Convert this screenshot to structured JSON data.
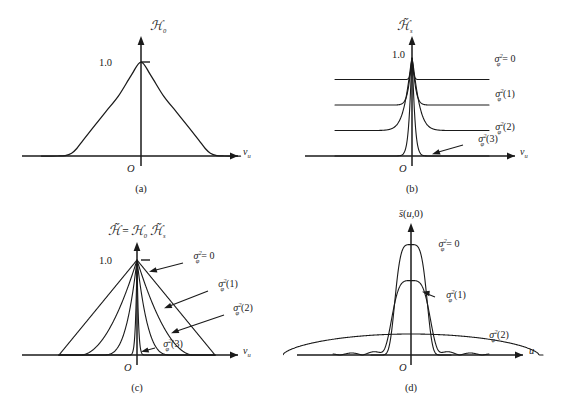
{
  "figure": {
    "background": "#ffffff",
    "ink": "#1a1a1a",
    "panel_count": 4
  },
  "chart_data": [
    {
      "id": "a",
      "type": "line",
      "caption": "(a)",
      "title": "",
      "ylabel": "H0",
      "ylabel_display": "ℋ₀",
      "xlabel": "νᵤ",
      "origin_label": "O",
      "ytick_labels": [
        "1.0"
      ],
      "ytick_values": [
        1.0
      ],
      "ylim": [
        0,
        1.18
      ],
      "xlim": [
        -1.55,
        1.55
      ],
      "grid": false,
      "legend": "none",
      "series": [
        {
          "name": "H0 triangle",
          "sigma_label": "",
          "description": "triangular autocorrelation-like function, peak 1.0 at nu=0, support [-1,1]",
          "x": [
            -1.55,
            -1.3,
            -1.18,
            -1.08,
            -1.0,
            -0.9,
            -0.75,
            -0.55,
            -0.35,
            -0.15,
            0.0,
            0.15,
            0.35,
            0.55,
            0.75,
            0.9,
            1.0,
            1.08,
            1.18,
            1.3,
            1.55
          ],
          "y": [
            0.0,
            0.0,
            0.005,
            0.03,
            0.08,
            0.17,
            0.3,
            0.47,
            0.64,
            0.86,
            1.0,
            0.86,
            0.64,
            0.47,
            0.3,
            0.17,
            0.08,
            0.03,
            0.005,
            0.0,
            0.0
          ]
        }
      ]
    },
    {
      "id": "b",
      "type": "line",
      "caption": "(b)",
      "title": "",
      "ylabel": "Hs tilde",
      "ylabel_display": "ℋ̃ₛ",
      "xlabel": "νᵤ",
      "origin_label": "O",
      "ytick_labels": [
        "1.0"
      ],
      "ytick_values": [
        1.0
      ],
      "ylim": [
        0,
        1.18
      ],
      "xlim": [
        -1.55,
        1.55
      ],
      "grid": false,
      "legend": "right-of-curve",
      "note": "Four curves drawn with vertical baseline offsets for clarity; all peak at 1.0",
      "series": [
        {
          "name": "sigma0",
          "sigma_label": "σ",
          "sigma_sup": "2",
          "sigma_sub": "φ",
          "sigma_arg": "= 0",
          "baseline": 0.78,
          "halfwidth": 0.03,
          "peak": 1.0,
          "arrow": false
        },
        {
          "name": "sigma1",
          "sigma_label": "σ",
          "sigma_sup": "2",
          "sigma_sub": "φ",
          "sigma_arg": "(1)",
          "baseline": 0.52,
          "halfwidth": 0.075,
          "peak": 1.0,
          "arrow": false
        },
        {
          "name": "sigma2",
          "sigma_label": "σ",
          "sigma_sup": "2",
          "sigma_sub": "φ",
          "sigma_arg": "(2)",
          "baseline": 0.26,
          "halfwidth": 0.15,
          "peak": 1.0,
          "arrow": false
        },
        {
          "name": "sigma3",
          "sigma_label": "σ",
          "sigma_sup": "2",
          "sigma_sub": "φ",
          "sigma_arg": "(3)",
          "baseline": 0.0,
          "halfwidth": 0.062,
          "peak": 1.0,
          "arrow": true
        }
      ]
    },
    {
      "id": "c",
      "type": "line",
      "caption": "(c)",
      "title": "H tilde = H0 Hs tilde",
      "title_display": "ℋ̃ = ℋ₀ ℋ̃ₛ",
      "ylabel": "",
      "xlabel": "νᵤ",
      "origin_label": "O",
      "ytick_labels": [
        "1.0"
      ],
      "ytick_values": [
        1.0
      ],
      "ylim": [
        0,
        1.18
      ],
      "xlim": [
        -1.55,
        1.55
      ],
      "grid": false,
      "legend": "arrow-callouts",
      "note": "Product of panel (a) triangle with panel (b) peaked curves; progressively narrower",
      "series": [
        {
          "name": "sigma0",
          "sigma_label": "σ",
          "sigma_sup": "2",
          "sigma_sub": "φ",
          "sigma_arg": "= 0",
          "width_scale": 1.0,
          "exponent": 1.0,
          "peak": 1.0
        },
        {
          "name": "sigma1",
          "sigma_label": "σ",
          "sigma_sup": "2",
          "sigma_sub": "φ",
          "sigma_arg": "(1)",
          "width_scale": 0.72,
          "exponent": 1.9,
          "peak": 1.0
        },
        {
          "name": "sigma2",
          "sigma_label": "σ",
          "sigma_sup": "2",
          "sigma_sub": "φ",
          "sigma_arg": "(2)",
          "width_scale": 0.45,
          "exponent": 3.2,
          "peak": 1.0
        },
        {
          "name": "sigma3",
          "sigma_label": "σ",
          "sigma_sup": "2",
          "sigma_sub": "φ",
          "sigma_arg": "(3)",
          "width_scale": 0.14,
          "exponent": 7.0,
          "peak": 1.0
        }
      ]
    },
    {
      "id": "d",
      "type": "line",
      "caption": "(d)",
      "title": "",
      "ylabel": "s bar (u,0)",
      "ylabel_display": "s̄(u,0)",
      "xlabel": "u",
      "origin_label": "O",
      "ytick_labels": [],
      "ytick_values": [],
      "ylim": [
        0,
        1.12
      ],
      "xlim": [
        -1.55,
        1.55
      ],
      "grid": false,
      "legend": "labels-near-curves",
      "note": "Point-spread functions: narrow tall main lobe broadens and collapses into wide low pedestal with ripples as sigma grows",
      "series": [
        {
          "name": "sigma0",
          "sigma_label": "σ",
          "sigma_sup": "2",
          "sigma_sub": "φ",
          "sigma_arg": "= 0",
          "peak": 0.92,
          "mainlobe_halfwidth": 0.175,
          "sidelobe_amp": 0.0,
          "pedestal": 0.0
        },
        {
          "name": "sigma1",
          "sigma_label": "σ",
          "sigma_sup": "2",
          "sigma_sub": "φ",
          "sigma_arg": "(1)",
          "peak": 0.62,
          "mainlobe_halfwidth": 0.21,
          "sidelobe_amp": 0.035,
          "pedestal": 0.02
        },
        {
          "name": "sigma2",
          "sigma_label": "σ",
          "sigma_sup": "2",
          "sigma_sub": "φ",
          "sigma_arg": "(2)",
          "peak": 0.175,
          "mainlobe_halfwidth": 1.28,
          "sidelobe_amp": 0.0,
          "pedestal": 0.0
        }
      ]
    }
  ]
}
